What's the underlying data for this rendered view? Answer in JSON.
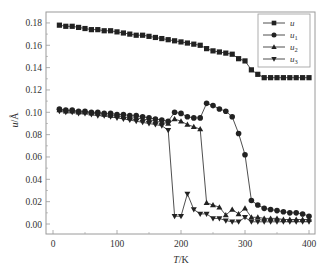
{
  "chart_data": {
    "type": "line",
    "title": "",
    "xlabel": "T/K",
    "ylabel": "u/Å",
    "xlim": [
      -10,
      410
    ],
    "ylim": [
      -0.01,
      0.188
    ],
    "xticks": [
      0,
      100,
      200,
      300,
      400
    ],
    "xtick_labels": [
      "0",
      "100",
      "200",
      "300",
      "400"
    ],
    "yticks": [
      0.0,
      0.02,
      0.04,
      0.06,
      0.08,
      0.1,
      0.12,
      0.14,
      0.16,
      0.18
    ],
    "ytick_labels": [
      "0.00",
      "0.02",
      "0.04",
      "0.06",
      "0.08",
      "0.10",
      "0.12",
      "0.14",
      "0.16",
      "0.18"
    ],
    "grid": false,
    "legend_position": "upper right",
    "x": [
      10,
      20,
      30,
      40,
      50,
      60,
      70,
      80,
      90,
      100,
      110,
      120,
      130,
      140,
      150,
      160,
      170,
      180,
      190,
      200,
      210,
      220,
      230,
      240,
      250,
      260,
      270,
      280,
      290,
      300,
      310,
      320,
      330,
      340,
      350,
      360,
      370,
      380,
      390,
      400
    ],
    "series": [
      {
        "name": "u",
        "marker": "square",
        "values": [
          0.178,
          0.177,
          0.177,
          0.176,
          0.175,
          0.174,
          0.174,
          0.173,
          0.173,
          0.172,
          0.171,
          0.17,
          0.169,
          0.169,
          0.168,
          0.167,
          0.166,
          0.165,
          0.164,
          0.163,
          0.162,
          0.161,
          0.16,
          0.157,
          0.155,
          0.154,
          0.153,
          0.152,
          0.148,
          0.146,
          0.138,
          0.134,
          0.131,
          0.131,
          0.131,
          0.131,
          0.131,
          0.131,
          0.131,
          0.131
        ]
      },
      {
        "name": "u1",
        "marker": "circle",
        "values": [
          0.103,
          0.102,
          0.102,
          0.101,
          0.101,
          0.1,
          0.1,
          0.099,
          0.099,
          0.098,
          0.098,
          0.097,
          0.097,
          0.096,
          0.095,
          0.094,
          0.093,
          0.092,
          0.1,
          0.099,
          0.096,
          0.095,
          0.095,
          0.108,
          0.106,
          0.103,
          0.101,
          0.096,
          0.081,
          0.062,
          0.021,
          0.017,
          0.014,
          0.013,
          0.012,
          0.011,
          0.01,
          0.01,
          0.009,
          0.007
        ]
      },
      {
        "name": "u2",
        "marker": "triangle-up",
        "values": [
          0.102,
          0.101,
          0.101,
          0.1,
          0.1,
          0.099,
          0.099,
          0.098,
          0.097,
          0.097,
          0.096,
          0.095,
          0.095,
          0.094,
          0.093,
          0.092,
          0.091,
          0.09,
          0.094,
          0.092,
          0.089,
          0.087,
          0.085,
          0.019,
          0.017,
          0.015,
          0.008,
          0.013,
          0.009,
          0.014,
          0.006,
          0.006,
          0.005,
          0.005,
          0.005,
          0.004,
          0.004,
          0.004,
          0.004,
          0.004
        ]
      },
      {
        "name": "u3",
        "marker": "triangle-down",
        "values": [
          0.101,
          0.1,
          0.1,
          0.099,
          0.099,
          0.098,
          0.097,
          0.097,
          0.096,
          0.095,
          0.094,
          0.093,
          0.092,
          0.091,
          0.09,
          0.089,
          0.088,
          0.084,
          0.007,
          0.007,
          0.027,
          0.013,
          0.009,
          0.009,
          0.005,
          0.005,
          0.003,
          0.002,
          0.002,
          0.006,
          0.002,
          0.002,
          0.002,
          0.002,
          0.002,
          0.002,
          0.002,
          0.002,
          0.002,
          0.002
        ]
      }
    ],
    "colors": {
      "series": "#222222",
      "axis": "#999999",
      "text": "#333333"
    }
  },
  "legend": {
    "items": [
      {
        "base": "u",
        "sub": ""
      },
      {
        "base": "u",
        "sub": "1"
      },
      {
        "base": "u",
        "sub": "2"
      },
      {
        "base": "u",
        "sub": "3"
      }
    ]
  },
  "axes": {
    "x_title_italic": "T",
    "x_title_unit": "/K",
    "y_title_italic": "u",
    "y_title_unit": "/Å"
  }
}
